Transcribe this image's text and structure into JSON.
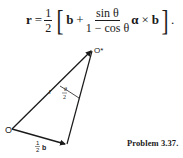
{
  "equation": {
    "lhs": "r",
    "equals": "=",
    "half_num": "1",
    "half_den": "2",
    "bracket_open": "[",
    "term_b": "b",
    "plus": "+",
    "frac_num": "sin θ",
    "frac_den": "1 − cos θ",
    "alpha": "α",
    "cross": "×",
    "term_b2": "b",
    "bracket_close": "]",
    "period": "."
  },
  "figure": {
    "origin_label": "O",
    "apex_label": "O*",
    "vector_r_label": "r",
    "angle_label_num": "θ",
    "angle_label_den": "2",
    "half_b_num": "1",
    "half_b_den": "2",
    "half_b_vec": "b"
  },
  "caption": "Problem 3.37."
}
